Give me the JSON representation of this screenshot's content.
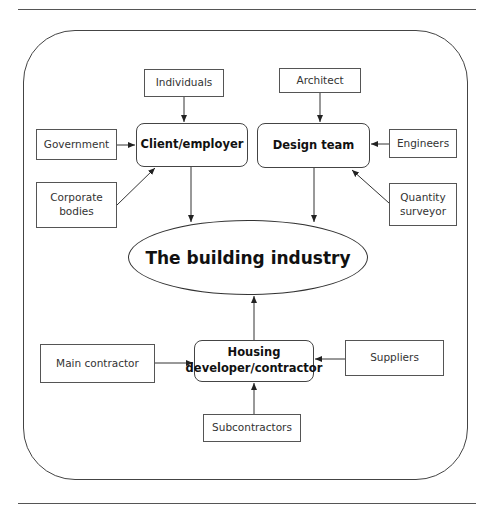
{
  "diagram": {
    "center": {
      "label": "The building industry"
    },
    "hubs": {
      "client": {
        "label": "Client/employer"
      },
      "design": {
        "label": "Design team"
      },
      "housing": {
        "label": "Housing\ndeveloper/contractor"
      }
    },
    "inputs": {
      "individuals": {
        "label": "Individuals",
        "target": "Client/employer"
      },
      "government": {
        "label": "Government",
        "target": "Client/employer"
      },
      "corporate": {
        "label": "Corporate\nbodies",
        "target": "Client/employer"
      },
      "architect": {
        "label": "Architect",
        "target": "Design team"
      },
      "engineers": {
        "label": "Engineers",
        "target": "Design team"
      },
      "quantity_surveyor": {
        "label": "Quantity\nsurveyor",
        "target": "Design team"
      },
      "main_contractor": {
        "label": "Main contractor",
        "target": "Housing developer/contractor"
      },
      "suppliers": {
        "label": "Suppliers",
        "target": "Housing developer/contractor"
      },
      "subcontractors": {
        "label": "Subcontractors",
        "target": "Housing developer/contractor"
      }
    },
    "edges": [
      {
        "from": "Individuals",
        "to": "Client/employer"
      },
      {
        "from": "Government",
        "to": "Client/employer"
      },
      {
        "from": "Corporate bodies",
        "to": "Client/employer"
      },
      {
        "from": "Architect",
        "to": "Design team"
      },
      {
        "from": "Engineers",
        "to": "Design team"
      },
      {
        "from": "Quantity surveyor",
        "to": "Design team"
      },
      {
        "from": "Client/employer",
        "to": "The building industry"
      },
      {
        "from": "Design team",
        "to": "The building industry"
      },
      {
        "from": "Main contractor",
        "to": "Housing developer/contractor"
      },
      {
        "from": "Suppliers",
        "to": "Housing developer/contractor"
      },
      {
        "from": "Subcontractors",
        "to": "Housing developer/contractor"
      },
      {
        "from": "Housing developer/contractor",
        "to": "The building industry"
      }
    ],
    "colors": {
      "line": "#333333",
      "background": "#ffffff",
      "text": "#1a1a1a"
    }
  }
}
